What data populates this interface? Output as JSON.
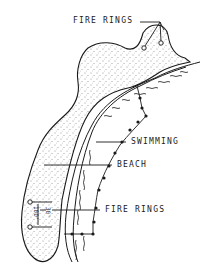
{
  "diagram": {
    "title": "",
    "labels": {
      "fire_rings_top": "FIRE RINGS",
      "swimming": "SWIMMING",
      "beach": "BEACH",
      "fire_rings_bottom": "FIRE RINGS"
    },
    "dimensions": {
      "spacing": "100'",
      "setback": "30'"
    },
    "colors": {
      "ink": "#1a1a1a",
      "background": "#ffffff"
    }
  }
}
